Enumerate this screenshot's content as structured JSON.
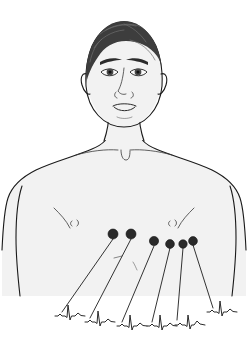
{
  "figure": {
    "background_color": "#ffffff",
    "skin_color": "#f2f2f2",
    "outline_color": "#1a1a1a",
    "hair_color": "#3d3d3d",
    "electrode_color": "#2a2a2a",
    "trace_color": "#2a2a2a",
    "width": 252,
    "height": 344
  },
  "anatomy": {
    "head": {
      "name": "head",
      "cx": 124,
      "cy": 72,
      "rx": 38,
      "ry": 52
    },
    "hair": {
      "name": "hair"
    },
    "neck": {
      "name": "neck"
    },
    "torso": {
      "name": "torso"
    },
    "left_clavicle": {
      "name": "clavicle-left"
    },
    "right_clavicle": {
      "name": "clavicle-right"
    },
    "sternal_notch": {
      "name": "sternal-notch"
    },
    "nipple_left": {
      "name": "nipple-left",
      "x": 75,
      "y": 222
    },
    "nipple_right": {
      "name": "nipple-right",
      "x": 173,
      "y": 222
    },
    "umbilicus": {
      "name": "navel",
      "x": 120,
      "y": 263
    }
  },
  "electrodes": [
    {
      "id": "V1",
      "cx": 131,
      "cy": 234,
      "r": 5.0,
      "trace_index": 0
    },
    {
      "id": "V2",
      "cx": 113,
      "cy": 234,
      "r": 5.0,
      "trace_index": 1
    },
    {
      "id": "V3",
      "cx": 154,
      "cy": 241,
      "r": 4.6,
      "trace_index": 2
    },
    {
      "id": "V4",
      "cx": 170,
      "cy": 244,
      "r": 4.4,
      "trace_index": 3
    },
    {
      "id": "V5",
      "cx": 183,
      "cy": 244,
      "r": 4.2,
      "trace_index": 4
    },
    {
      "id": "V6",
      "cx": 193,
      "cy": 241,
      "r": 4.4,
      "trace_index": 5
    }
  ],
  "lead_lines": [
    {
      "from_electrode": "V2",
      "x1": 113,
      "y1": 239,
      "x2": 62,
      "y2": 312
    },
    {
      "from_electrode": "V1",
      "x1": 131,
      "y1": 239,
      "x2": 90,
      "y2": 318
    },
    {
      "from_electrode": "V3",
      "x1": 154,
      "y1": 246,
      "x2": 122,
      "y2": 322
    },
    {
      "from_electrode": "V4",
      "x1": 170,
      "y1": 248,
      "x2": 152,
      "y2": 322
    },
    {
      "from_electrode": "V5",
      "x1": 183,
      "y1": 248,
      "x2": 177,
      "y2": 320
    },
    {
      "from_electrode": "V6",
      "x1": 193,
      "y1": 245,
      "x2": 213,
      "y2": 308
    }
  ],
  "ecg_traces": [
    {
      "id": "trace-V1",
      "x": 55,
      "y": 316,
      "scale": 1.0
    },
    {
      "id": "trace-V2",
      "x": 85,
      "y": 322,
      "scale": 1.0
    },
    {
      "id": "trace-V3",
      "x": 117,
      "y": 326,
      "scale": 1.0
    },
    {
      "id": "trace-V4",
      "x": 147,
      "y": 326,
      "scale": 1.0
    },
    {
      "id": "trace-V5",
      "x": 175,
      "y": 325,
      "scale": 1.0
    },
    {
      "id": "trace-V6",
      "x": 207,
      "y": 312,
      "scale": 1.0
    }
  ],
  "ecg_waveform": {
    "description": "QRS complex with small P wave and T wave",
    "path": "M0,0 L3,0 L5,-2 L7,0 L10,0 L12,1.5 L13,-11 L15,4 L16.5,0 L20,0 L23,-3 L26,-0.5 L30,0"
  }
}
